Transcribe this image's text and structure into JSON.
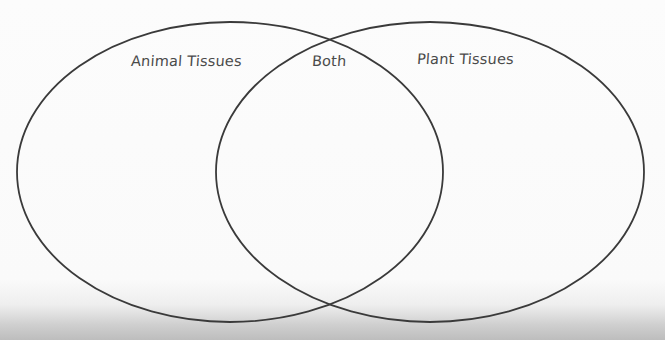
{
  "diagram": {
    "type": "venn",
    "sets": [
      {
        "id": "left",
        "label": "Animal Tissues",
        "cx": 230,
        "cy": 172,
        "rx": 213,
        "ry": 150
      },
      {
        "id": "right",
        "label": "Plant Tissues",
        "cx": 430,
        "cy": 172,
        "rx": 214,
        "ry": 150
      }
    ],
    "intersection_label": "Both",
    "stroke_color": "#3a3a3a",
    "background_color": "#fbfbfb"
  },
  "labels": {
    "left": "Animal Tissues",
    "both": "Both",
    "right": "Plant Tissues"
  },
  "footer": {
    "copyright_fragment": "ers, Inc."
  }
}
